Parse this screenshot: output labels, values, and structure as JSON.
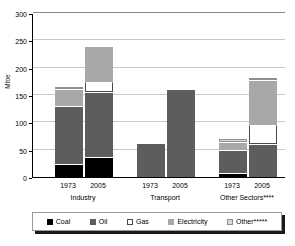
{
  "chart_data": {
    "type": "bar",
    "title": "",
    "subtitle": "",
    "xlabel": "",
    "ylabel": "Mtoe",
    "ylim": [
      0,
      300
    ],
    "ytick_labels": [
      "300",
      "250",
      "200",
      "150",
      "100",
      "50",
      "0"
    ],
    "ytick_values": [
      300,
      250,
      200,
      150,
      100,
      50,
      0
    ],
    "grid": true,
    "stacked": true,
    "legend_position": "bottom",
    "groups": [
      {
        "name": "Industry",
        "label": "Industry",
        "bars": [
          {
            "year": "1973",
            "total": 165
          },
          {
            "year": "2005",
            "total": 238
          }
        ]
      },
      {
        "name": "Transport",
        "label": "Transport",
        "bars": [
          {
            "year": "1973",
            "total": 60
          },
          {
            "year": "2005",
            "total": 160
          }
        ]
      },
      {
        "name": "Other Sectors",
        "label": "Other Sectors****",
        "bars": [
          {
            "year": "1973",
            "total": 69
          },
          {
            "year": "2005",
            "total": 182
          }
        ]
      }
    ],
    "categories": [
      "Industry 1973",
      "Industry 2005",
      "Transport 1973",
      "Transport 2005",
      "Other Sectors 1973",
      "Other Sectors 2005"
    ],
    "series": [
      {
        "name": "Coal",
        "color": "#000000",
        "values": [
          25,
          36,
          0,
          0,
          8,
          0
        ]
      },
      {
        "name": "Oil",
        "color": "#5d5d5d",
        "values": [
          105,
          120,
          60,
          160,
          42,
          60
        ]
      },
      {
        "name": "Gas",
        "color": "#ffffff",
        "values": [
          0,
          18,
          0,
          0,
          0,
          35
        ]
      },
      {
        "name": "Electricity",
        "color": "#a8a8a8",
        "values": [
          32,
          64,
          0,
          0,
          14,
          83
        ]
      },
      {
        "name": "Other*****",
        "color": "#d8d8d8",
        "values": [
          3,
          0,
          0,
          0,
          5,
          4
        ]
      }
    ],
    "bars_detail": [
      {
        "group": "Industry",
        "year": "1973",
        "total": 165,
        "segments": [
          {
            "key": "coal",
            "label": "Coal",
            "value": 25
          },
          {
            "key": "oil",
            "label": "Oil",
            "value": 105
          },
          {
            "key": "electricity",
            "label": "Electricity",
            "value": 32
          },
          {
            "key": "other",
            "label": "Other*****",
            "value": 3
          }
        ]
      },
      {
        "group": "Industry",
        "year": "2005",
        "total": 238,
        "segments": [
          {
            "key": "coal",
            "label": "Coal",
            "value": 36
          },
          {
            "key": "oil",
            "label": "Oil",
            "value": 120
          },
          {
            "key": "gas",
            "label": "Gas",
            "value": 18
          },
          {
            "key": "electricity",
            "label": "Electricity",
            "value": 64
          }
        ]
      },
      {
        "group": "Transport",
        "year": "1973",
        "total": 60,
        "segments": [
          {
            "key": "oil",
            "label": "Oil",
            "value": 60
          }
        ]
      },
      {
        "group": "Transport",
        "year": "2005",
        "total": 160,
        "segments": [
          {
            "key": "oil",
            "label": "Oil",
            "value": 160
          }
        ]
      },
      {
        "group": "Other Sectors",
        "year": "1973",
        "total": 69,
        "segments": [
          {
            "key": "coal",
            "label": "Coal",
            "value": 8
          },
          {
            "key": "oil",
            "label": "Oil",
            "value": 42
          },
          {
            "key": "electricity",
            "label": "Electricity",
            "value": 14
          },
          {
            "key": "other",
            "label": "Other*****",
            "value": 5
          }
        ]
      },
      {
        "group": "Other Sectors",
        "year": "2005",
        "total": 182,
        "segments": [
          {
            "key": "oil",
            "label": "Oil",
            "value": 60
          },
          {
            "key": "gas",
            "label": "Gas",
            "value": 35
          },
          {
            "key": "electricity",
            "label": "Electricity",
            "value": 83
          },
          {
            "key": "other",
            "label": "Other*****",
            "value": 4
          }
        ]
      }
    ],
    "legend": [
      {
        "key": "coal",
        "label": "Coal",
        "color": "#000000"
      },
      {
        "key": "oil",
        "label": "Oil",
        "color": "#5d5d5d"
      },
      {
        "key": "gas",
        "label": "Gas",
        "color": "#ffffff"
      },
      {
        "key": "electricity",
        "label": "Electricity",
        "color": "#a8a8a8"
      },
      {
        "key": "other",
        "label": "Other*****",
        "color": "#d8d8d8"
      }
    ]
  },
  "axis": {
    "y_title": "Mtoe",
    "y_max": 300,
    "y_min": 0,
    "y_step": 50
  },
  "x_axis": {
    "year_labels": [
      "1973",
      "2005",
      "1973",
      "2005",
      "1973",
      "2005"
    ],
    "group_labels": [
      "Industry",
      "Transport",
      "Other Sectors****"
    ]
  }
}
